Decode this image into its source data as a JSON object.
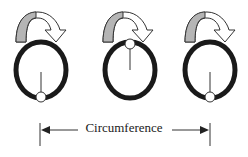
{
  "diagram": {
    "label": "Circumference",
    "colors": {
      "rim": "#1a1a1a",
      "arrow_fill": "#b5b5b5",
      "arrow_stroke": "#333333",
      "background": "#ffffff"
    },
    "wheels": [
      {
        "id": 1,
        "marker_position": "bottom"
      },
      {
        "id": 2,
        "marker_position": "top"
      },
      {
        "id": 3,
        "marker_position": "bottom"
      }
    ]
  }
}
